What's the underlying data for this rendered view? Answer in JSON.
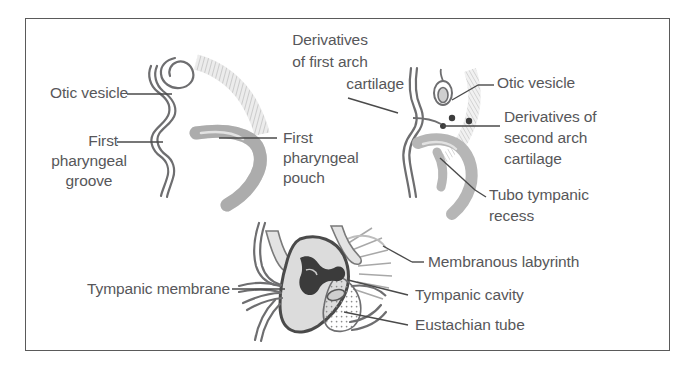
{
  "figure": {
    "frame_color": "#5a5a5a",
    "background_color": "#ffffff",
    "label_color": "#57575a",
    "diagram_stroke": "#6e6e70",
    "diagram_fill_light": "#d9d9d9",
    "diagram_fill_mid": "#b0b0b0",
    "diagram_fill_dark": "#3d3d3d"
  },
  "panels": [
    {
      "id": "panel-top-left",
      "name": "early-stage-otic-vesicle",
      "labels": [
        "label-otic-vesicle-left",
        "label-first-pharyngeal-groove",
        "label-first-pharyngeal-pouch"
      ]
    },
    {
      "id": "panel-top-right",
      "name": "arch-cartilage-derivatives",
      "labels": [
        "label-derivatives-first-arch",
        "label-otic-vesicle-right",
        "label-derivatives-second-arch",
        "label-tubo-tympanic-recess"
      ]
    },
    {
      "id": "panel-bottom",
      "name": "mature-middle-ear",
      "labels": [
        "label-tympanic-membrane",
        "label-membranous-labyrinth",
        "label-tympanic-cavity",
        "label-eustachian-tube"
      ]
    }
  ],
  "labels": {
    "otic_vesicle_left": "Otic vesicle",
    "first_pharyngeal_groove_l1": "First",
    "first_pharyngeal_groove_l2": "pharyngeal",
    "first_pharyngeal_groove_l3": "groove",
    "first_pharyngeal_pouch_l1": "First",
    "first_pharyngeal_pouch_l2": "pharyngeal",
    "first_pharyngeal_pouch_l3": "pouch",
    "derivatives_first_arch_l1": "Derivatives",
    "derivatives_first_arch_l2": "of first arch",
    "derivatives_first_arch_l3": "cartilage",
    "otic_vesicle_right": "Otic vesicle",
    "derivatives_second_arch_l1": "Derivatives of",
    "derivatives_second_arch_l2": "second arch",
    "derivatives_second_arch_l3": "cartilage",
    "tubo_tympanic_recess_l1": "Tubo tympanic",
    "tubo_tympanic_recess_l2": "recess",
    "tympanic_membrane": "Tympanic membrane",
    "membranous_labyrinth": "Membranous labyrinth",
    "tympanic_cavity": "Tympanic cavity",
    "eustachian_tube": "Eustachian tube"
  }
}
